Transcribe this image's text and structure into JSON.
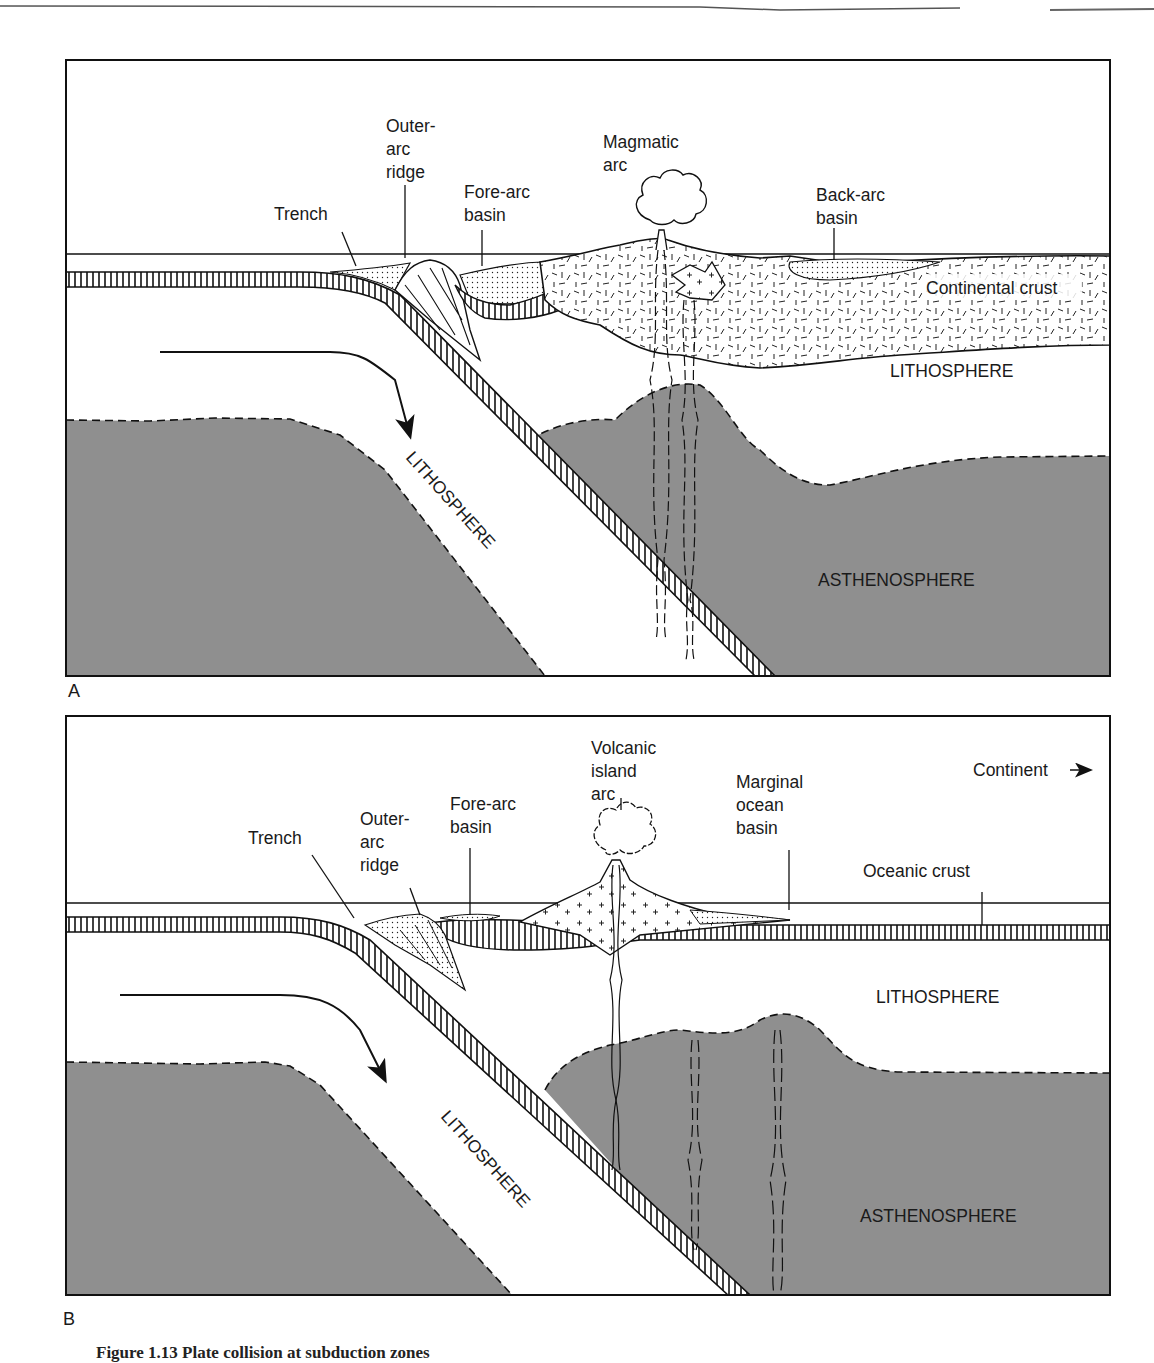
{
  "figure": {
    "caption": "Figure 1.13  Plate collision at subduction zones",
    "colors": {
      "asthenosphere": "#8f8f8f",
      "line": "#111111",
      "background": "#ffffff"
    },
    "panels": [
      {
        "id": "A",
        "letter": "A",
        "labels": {
          "trench": "Trench",
          "outer_arc_ridge": [
            "Outer-",
            "arc",
            "ridge"
          ],
          "fore_arc_basin": [
            "Fore-arc",
            "basin"
          ],
          "magmatic_arc": [
            "Magmatic",
            "arc"
          ],
          "back_arc_basin": [
            "Back-arc",
            "basin"
          ],
          "continental_crust": "Continental crust",
          "lithosphere_right": "LITHOSPHERE",
          "lithosphere_slab": "LITHOSPHERE",
          "asthenosphere": "ASTHENOSPHERE"
        }
      },
      {
        "id": "B",
        "letter": "B",
        "labels": {
          "trench": "Trench",
          "outer_arc_ridge": [
            "Outer-",
            "arc",
            "ridge"
          ],
          "fore_arc_basin": [
            "Fore-arc",
            "basin"
          ],
          "volcanic_island_arc": [
            "Volcanic",
            "island",
            "arc"
          ],
          "marginal_ocean_basin": [
            "Marginal",
            "ocean",
            "basin"
          ],
          "continent": "Continent",
          "oceanic_crust": "Oceanic crust",
          "lithosphere_right": "LITHOSPHERE",
          "lithosphere_slab": "LITHOSPHERE",
          "asthenosphere": "ASTHENOSPHERE"
        }
      }
    ]
  }
}
